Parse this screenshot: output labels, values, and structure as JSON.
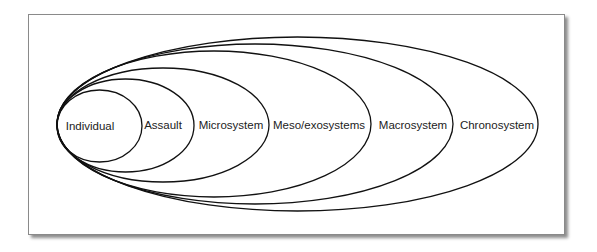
{
  "diagram": {
    "type": "nested-ellipses",
    "stroke_color": "#111111",
    "layers": [
      {
        "label": "Individual",
        "cx": 99.5,
        "cy": 126,
        "rx": 42.5,
        "ry": 36,
        "label_x": 90,
        "label_y": 130
      },
      {
        "label": "Assault",
        "cx": 125.5,
        "cy": 125.5,
        "rx": 68.5,
        "ry": 46.5,
        "label_x": 163,
        "label_y": 129
      },
      {
        "label": "Microsystem",
        "cx": 163,
        "cy": 125,
        "rx": 106,
        "ry": 57,
        "label_x": 231,
        "label_y": 129
      },
      {
        "label": "Meso/exosystems",
        "cx": 214,
        "cy": 124,
        "rx": 157,
        "ry": 73,
        "label_x": 319,
        "label_y": 129
      },
      {
        "label": "Macrosystem",
        "cx": 255,
        "cy": 124,
        "rx": 198,
        "ry": 80,
        "label_x": 413,
        "label_y": 129
      },
      {
        "label": "Chronosystem",
        "cx": 297.5,
        "cy": 124,
        "rx": 240.5,
        "ry": 87,
        "label_x": 497,
        "label_y": 129
      }
    ]
  }
}
